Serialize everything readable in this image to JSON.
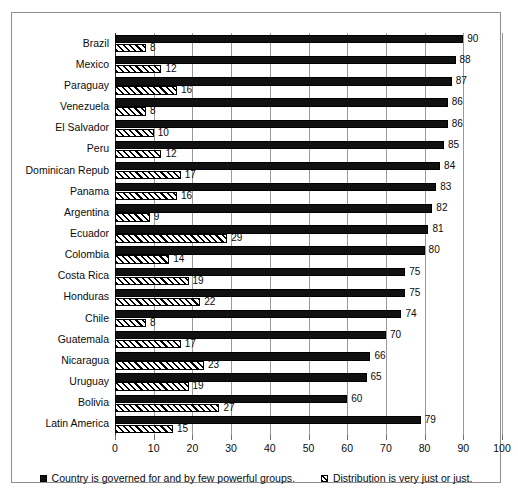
{
  "chart_data": {
    "type": "bar",
    "orientation": "horizontal",
    "title": "",
    "xlabel": "",
    "ylabel": "",
    "xlim": [
      0,
      100
    ],
    "xticks": [
      0,
      10,
      20,
      30,
      40,
      50,
      60,
      70,
      80,
      90,
      100
    ],
    "grid": true,
    "legend_position": "bottom",
    "categories": [
      "Brazil",
      "Mexico",
      "Paraguay",
      "Venezuela",
      "El Salvador",
      "Peru",
      "Dominican Repub",
      "Panama",
      "Argentina",
      "Ecuador",
      "Colombia",
      "Costa Rica",
      "Honduras",
      "Chile",
      "Guatemala",
      "Nicaragua",
      "Uruguay",
      "Bolivia",
      "Latin America"
    ],
    "series": [
      {
        "name": "Country is governed for and by few powerful groups.",
        "style": "solid-black",
        "color": "#111111",
        "values": [
          90,
          88,
          87,
          86,
          86,
          85,
          84,
          83,
          82,
          81,
          80,
          75,
          75,
          74,
          70,
          66,
          65,
          60,
          79
        ]
      },
      {
        "name": "Distribution is very just or just.",
        "style": "diagonal-hatch",
        "color": "#000000",
        "values": [
          8,
          12,
          16,
          8,
          10,
          12,
          17,
          16,
          9,
          29,
          14,
          19,
          22,
          8,
          17,
          23,
          19,
          27,
          15
        ]
      }
    ]
  },
  "legend": {
    "items": [
      {
        "marker": "solid-square-icon",
        "label": "Country is governed for and by few powerful groups."
      },
      {
        "marker": "hatch-square-icon",
        "label": "Distribution is very just or just."
      }
    ]
  }
}
